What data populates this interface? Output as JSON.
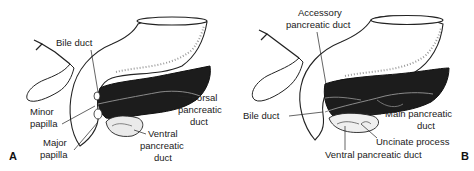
{
  "figure": {
    "panels": [
      {
        "letter": "A",
        "labels": {
          "bile_duct": "Bile duct",
          "minor_papilla_1": "Minor",
          "minor_papilla_2": "papilla",
          "major_papilla_1": "Major",
          "major_papilla_2": "papilla",
          "dorsal_duct_1": "Dorsal",
          "dorsal_duct_2": "pancreatic",
          "dorsal_duct_3": "duct",
          "ventral_duct_1": "Ventral",
          "ventral_duct_2": "pancreatic",
          "ventral_duct_3": "duct"
        }
      },
      {
        "letter": "B",
        "labels": {
          "accessory_duct_1": "Accessory",
          "accessory_duct_2": "pancreatic duct",
          "bile_duct": "Bile duct",
          "main_duct_1": "Main pancreatic",
          "main_duct_2": "duct",
          "uncinate_process": "Uncinate process",
          "ventral_duct": "Ventral pancreatic duct"
        }
      }
    ],
    "colors": {
      "pancreas": "#1c1c1c",
      "outline": "#222222",
      "stomach_fill": "#ffffff",
      "stipple": "#9a9a9a",
      "duct_line": "#8a8a8a",
      "text": "#1a1a1a"
    }
  }
}
